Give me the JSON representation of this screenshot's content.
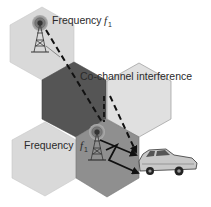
{
  "diagram": {
    "labels": {
      "top_frequency": "Frequency",
      "top_frequency_symbol": "f",
      "top_frequency_subscript": "1",
      "interference": "Co-channel interference",
      "bottom_frequency": "Frequency",
      "bottom_frequency_symbol": "f",
      "bottom_frequency_subscript": "1"
    },
    "cells": [
      {
        "name": "cell-top-left",
        "color": "#d9d9d9",
        "role": "interfering cell (f1)"
      },
      {
        "name": "cell-center-dark",
        "color": "#555555",
        "role": "intermediate cell"
      },
      {
        "name": "cell-right-light",
        "color": "#e0e0e0",
        "role": "neighbor cell"
      },
      {
        "name": "cell-bottom-left",
        "color": "#d9d9d9",
        "role": "neighbor cell"
      },
      {
        "name": "cell-bottom-serving",
        "color": "#8f8f8f",
        "role": "serving cell (f1)"
      }
    ],
    "colors": {
      "hex_stroke": "#9a9a9a",
      "signal_line": "#111111",
      "tower": "#333333",
      "antenna_glow": "#7a7a7a"
    },
    "icons": [
      "cell-tower-icon",
      "cell-tower-icon",
      "car-icon",
      "lightning-signal-icon"
    ]
  }
}
